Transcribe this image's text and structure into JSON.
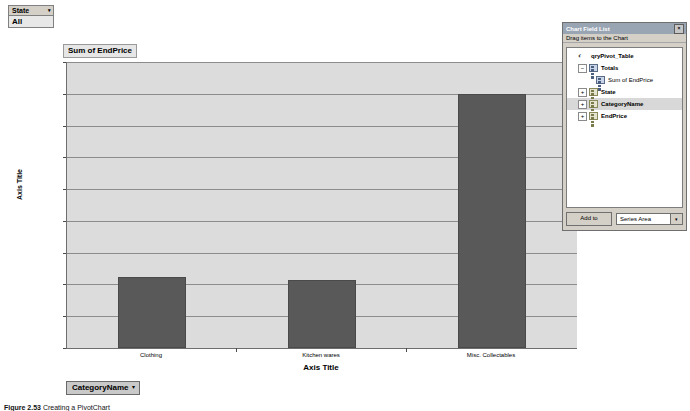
{
  "filter": {
    "name": "State",
    "caret": "▾",
    "value": "All"
  },
  "chart": {
    "series_title": "Sum of EndPrice",
    "y_axis_title": "Axis Title",
    "x_axis_title": "Axis Title",
    "category_button": {
      "label": "CategoryName",
      "caret": "▾"
    }
  },
  "chart_data": {
    "type": "bar",
    "title": "Sum of EndPrice",
    "xlabel": "Axis Title",
    "ylabel": "Axis Title",
    "categories": [
      "Clothing",
      "Kitchen wares",
      "Misc. Collectables"
    ],
    "values": [
      112,
      107,
      400
    ],
    "ylim": [
      0,
      450
    ],
    "ytick_labels": [
      "$450.00",
      "$400.00",
      "$350.00",
      "$300.00",
      "$250.00",
      "$200.00",
      "$150.00",
      "$100.00",
      "$50.00",
      "$0.00"
    ],
    "ytick_values": [
      450,
      400,
      350,
      300,
      250,
      200,
      150,
      100,
      50,
      0
    ],
    "grid": true,
    "legend": false,
    "series": [
      {
        "name": "Sum of EndPrice",
        "values": [
          112,
          107,
          400
        ]
      }
    ],
    "bar_color": "#595959",
    "plot_background": "#dcdcdc"
  },
  "field_list": {
    "title": "Chart Field List",
    "close_glyph": "×",
    "instruction": "Drag items to the Chart",
    "tree": [
      {
        "label": "qryPivot_Table",
        "icon": "database-icon",
        "indent": 0,
        "expander": "",
        "bold": true,
        "selected": false
      },
      {
        "label": "Totals",
        "icon": "totals-icon",
        "indent": 1,
        "expander": "−",
        "bold": true,
        "selected": false
      },
      {
        "label": "Sum of EndPrice",
        "icon": "field-icon",
        "indent": 2,
        "expander": "",
        "bold": false,
        "selected": false
      },
      {
        "label": "State",
        "icon": "table-icon",
        "indent": 1,
        "expander": "+",
        "bold": true,
        "selected": false
      },
      {
        "label": "CategoryName",
        "icon": "table-icon",
        "indent": 1,
        "expander": "+",
        "bold": true,
        "selected": true
      },
      {
        "label": "EndPrice",
        "icon": "table-icon",
        "indent": 1,
        "expander": "+",
        "bold": true,
        "selected": false
      }
    ],
    "add_to_label": "Add to",
    "target_area": "Series Area",
    "combo_caret": "▾"
  },
  "caption": {
    "number": "Figure 2.53",
    "text": "Creating a PivotChart"
  }
}
